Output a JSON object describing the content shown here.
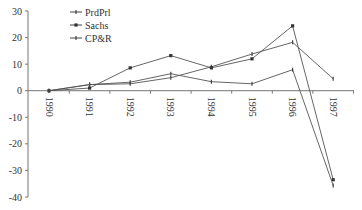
{
  "chart_data": {
    "type": "line",
    "title": "",
    "xlabel": "",
    "ylabel": "",
    "categories": [
      "1990",
      "1991",
      "1992",
      "1993",
      "1994",
      "1995",
      "1996",
      "1997"
    ],
    "ylim": [
      -40,
      30
    ],
    "yticks": [
      30,
      20,
      10,
      0,
      -10,
      -20,
      -30,
      -40
    ],
    "grid": false,
    "legend_position": "top-left inside",
    "series": [
      {
        "name": "PrdPrl",
        "marker": "dash",
        "values": [
          0,
          2.3,
          2.6,
          4.9,
          9.0,
          13.8,
          18.2,
          4.5
        ]
      },
      {
        "name": "Sachs",
        "marker": "square",
        "values": [
          0,
          1.0,
          8.6,
          13.2,
          8.6,
          12.0,
          24.4,
          -33.5
        ]
      },
      {
        "name": "CP&R",
        "marker": "dash",
        "values": [
          0,
          2.3,
          3.2,
          6.4,
          3.4,
          2.6,
          7.9,
          -35.7
        ]
      }
    ]
  },
  "colors": {
    "line": "#555555",
    "axis": "#777777",
    "text": "#333333",
    "background": "#ffffff"
  }
}
